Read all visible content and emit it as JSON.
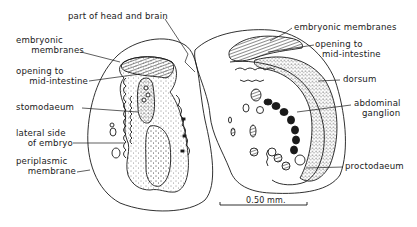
{
  "figure": {
    "type": "anatomical-section-drawing",
    "subjects": [
      "left-embryo-section",
      "right-embryo-section"
    ],
    "ink_color": "#1a1a1a",
    "background": "#ffffff"
  },
  "labels": {
    "left": {
      "embryonic_membranes_1": "embryonic",
      "embryonic_membranes_2": "membranes",
      "opening_1": "opening to",
      "opening_2": "mid-intestine",
      "stomodaeum": "stomodaeum",
      "lateral_1": "lateral side",
      "lateral_2": "of embryo",
      "periplasmic_1": "periplasmic",
      "periplasmic_2": "membrane"
    },
    "top": {
      "head_brain": "part of head and brain"
    },
    "right": {
      "embryonic_membranes": "embryonic membranes",
      "opening_1": "opening to",
      "opening_2": "mid-intestine",
      "dorsum": "dorsum",
      "abdominal_1": "abdominal",
      "abdominal_2": "ganglion",
      "proctodaeum": "proctodaeum"
    }
  },
  "scale_bar": {
    "label": "0.50 mm."
  }
}
